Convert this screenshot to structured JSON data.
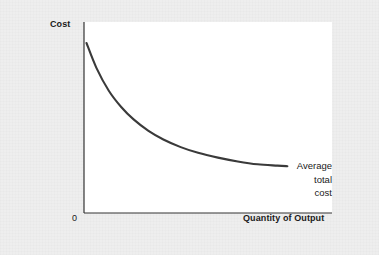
{
  "figure": {
    "background_color": "#eeeeee",
    "plot_background_color": "#ffffff",
    "axis_color": "#333333",
    "curve_color": "#3a3a3a"
  },
  "labels": {
    "y_axis_title": "Cost",
    "x_axis_title": "Quantity of Output",
    "origin": "0",
    "curve_label_line1": "Average",
    "curve_label_line2": "total",
    "curve_label_line3": "cost"
  },
  "chart_data": {
    "type": "line",
    "title": "",
    "subtitle": "",
    "xlabel": "Quantity of Output",
    "ylabel": "Cost",
    "grid": false,
    "legend_position": "inline-right-end",
    "annotations": [
      {
        "text": "Average total cost",
        "target_point": [
          0.82,
          0.25
        ],
        "placement": "right-of-curve-end"
      }
    ],
    "axis_ticks": {
      "x": [
        "0"
      ],
      "y": []
    },
    "xlim": [
      0,
      1
    ],
    "ylim": [
      0,
      1
    ],
    "series": [
      {
        "name": "Average total cost",
        "shape": "decreasing-convex",
        "x": [
          0.01,
          0.05,
          0.1,
          0.15,
          0.2,
          0.26,
          0.32,
          0.39,
          0.46,
          0.54,
          0.62,
          0.7,
          0.78,
          0.82
        ],
        "y": [
          0.89,
          0.76,
          0.64,
          0.555,
          0.49,
          0.43,
          0.385,
          0.345,
          0.315,
          0.29,
          0.27,
          0.255,
          0.248,
          0.245
        ]
      }
    ]
  },
  "geometry": {
    "plot_left_px": 84,
    "plot_top_px": 22,
    "plot_width_px": 248,
    "plot_height_px": 191
  }
}
